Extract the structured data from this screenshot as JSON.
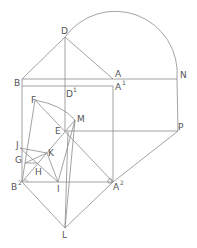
{
  "diagram": {
    "type": "geometric-construction",
    "stroke_color": "#8c8c8c",
    "label_color": "#555555",
    "points": [
      {
        "name": "D",
        "label": "D",
        "sup": "",
        "x": 65,
        "y": 37
      },
      {
        "name": "B",
        "label": "B",
        "sup": "",
        "x": 22,
        "y": 79
      },
      {
        "name": "A",
        "label": "A",
        "sup": "",
        "x": 113,
        "y": 79
      },
      {
        "name": "N",
        "label": "N",
        "sup": "",
        "x": 177,
        "y": 79
      },
      {
        "name": "D1",
        "label": "D",
        "sup": "1",
        "x": 65,
        "y": 86
      },
      {
        "name": "A1",
        "label": "A",
        "sup": "1",
        "x": 113,
        "y": 86
      },
      {
        "name": "F",
        "label": "F",
        "sup": "",
        "x": 35,
        "y": 100
      },
      {
        "name": "M",
        "label": "M",
        "sup": "",
        "x": 75,
        "y": 120
      },
      {
        "name": "E",
        "label": "E",
        "sup": "",
        "x": 65,
        "y": 131
      },
      {
        "name": "P",
        "label": "P",
        "sup": "",
        "x": 178,
        "y": 131
      },
      {
        "name": "J",
        "label": "J",
        "sup": "",
        "x": 20,
        "y": 148
      },
      {
        "name": "G",
        "label": "G",
        "sup": "",
        "x": 25,
        "y": 159
      },
      {
        "name": "K",
        "label": "K",
        "sup": "",
        "x": 47,
        "y": 153
      },
      {
        "name": "H",
        "label": "H",
        "sup": "",
        "x": 37,
        "y": 164
      },
      {
        "name": "B2",
        "label": "B",
        "sup": "2",
        "x": 22,
        "y": 182
      },
      {
        "name": "I",
        "label": "I",
        "sup": "",
        "x": 58,
        "y": 182
      },
      {
        "name": "A2",
        "label": "A",
        "sup": "2",
        "x": 113,
        "y": 182
      },
      {
        "name": "L",
        "label": "L",
        "sup": "",
        "x": 65,
        "y": 228
      }
    ]
  }
}
